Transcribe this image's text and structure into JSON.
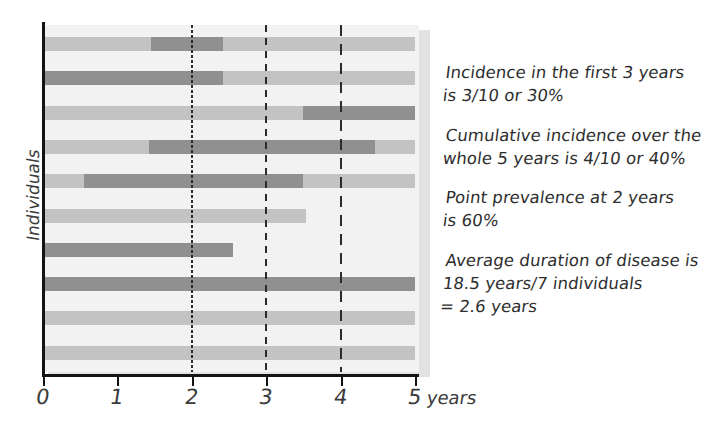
{
  "chart_data": {
    "type": "bar",
    "title": "",
    "subtitle": "",
    "xlabel": "years",
    "ylabel": "Individuals",
    "xlim": [
      0,
      5
    ],
    "x_ticks": [
      0,
      1,
      2,
      3,
      4,
      5
    ],
    "x_tick_labels": [
      "0",
      "1",
      "2",
      "3",
      "4",
      "5"
    ],
    "x_unit_label": "years",
    "grid": false,
    "legend": "none",
    "colors": {
      "healthy": "#c3c3c3",
      "diseased": "#909090",
      "plot_background": "#f2f2f2",
      "axis": "#141414",
      "reference_line": "#2b2b2b",
      "text": "#2e2e2e"
    },
    "reference_lines": [
      {
        "x": 2,
        "style": "dotted",
        "label": "2 years"
      },
      {
        "x": 3,
        "style": "dashed",
        "label": "3 years"
      },
      {
        "x": 4,
        "style": "long-dashed",
        "label": "4 years"
      }
    ],
    "categories": [
      "Individual 1",
      "Individual 2",
      "Individual 3",
      "Individual 4",
      "Individual 5",
      "Individual 6",
      "Individual 7",
      "Individual 8",
      "Individual 9",
      "Individual 10"
    ],
    "series": [
      {
        "name": "Individual 1",
        "follow_up": [
          0,
          5
        ],
        "segments": [
          {
            "start": 0,
            "end": 1.45,
            "state": "healthy"
          },
          {
            "start": 1.45,
            "end": 2.42,
            "state": "diseased"
          },
          {
            "start": 2.42,
            "end": 5,
            "state": "healthy"
          }
        ]
      },
      {
        "name": "Individual 2",
        "follow_up": [
          0,
          5
        ],
        "segments": [
          {
            "start": 0,
            "end": 2.42,
            "state": "diseased"
          },
          {
            "start": 2.42,
            "end": 5,
            "state": "healthy"
          }
        ]
      },
      {
        "name": "Individual 3",
        "follow_up": [
          0,
          5
        ],
        "segments": [
          {
            "start": 0,
            "end": 3.5,
            "state": "healthy"
          },
          {
            "start": 3.5,
            "end": 5,
            "state": "diseased"
          }
        ]
      },
      {
        "name": "Individual 4",
        "follow_up": [
          0,
          5
        ],
        "segments": [
          {
            "start": 0,
            "end": 1.42,
            "state": "healthy"
          },
          {
            "start": 1.42,
            "end": 4.46,
            "state": "diseased"
          },
          {
            "start": 4.46,
            "end": 5,
            "state": "healthy"
          }
        ]
      },
      {
        "name": "Individual 5",
        "follow_up": [
          0,
          5
        ],
        "segments": [
          {
            "start": 0,
            "end": 0.55,
            "state": "healthy"
          },
          {
            "start": 0.55,
            "end": 3.5,
            "state": "diseased"
          },
          {
            "start": 3.5,
            "end": 5,
            "state": "healthy"
          }
        ]
      },
      {
        "name": "Individual 6",
        "follow_up": [
          0,
          3.53
        ],
        "segments": [
          {
            "start": 0,
            "end": 3.53,
            "state": "healthy"
          }
        ]
      },
      {
        "name": "Individual 7",
        "follow_up": [
          0,
          2.55
        ],
        "segments": [
          {
            "start": 0,
            "end": 2.55,
            "state": "diseased"
          }
        ]
      },
      {
        "name": "Individual 8",
        "follow_up": [
          0,
          5
        ],
        "segments": [
          {
            "start": 0,
            "end": 5,
            "state": "diseased"
          }
        ]
      },
      {
        "name": "Individual 9",
        "follow_up": [
          0,
          5
        ],
        "segments": [
          {
            "start": 0,
            "end": 5,
            "state": "healthy"
          }
        ]
      },
      {
        "name": "Individual 10",
        "follow_up": [
          0,
          5
        ],
        "segments": [
          {
            "start": 0,
            "end": 5,
            "state": "healthy"
          }
        ]
      }
    ],
    "annotations": [
      {
        "id": "incidence",
        "lines": [
          "Incidence in the first 3 years",
          "is 3/10 or 30%"
        ]
      },
      {
        "id": "cumulative-incidence",
        "lines": [
          "Cumulative incidence over the",
          "whole 5 years is 4/10 or 40%"
        ]
      },
      {
        "id": "point-prevalence",
        "lines": [
          "Point prevalence at 2 years",
          "is 60%"
        ]
      },
      {
        "id": "average-duration",
        "lines": [
          "Average duration of disease is",
          "18.5 years/7 individuals",
          "= 2.6 years"
        ]
      }
    ]
  }
}
